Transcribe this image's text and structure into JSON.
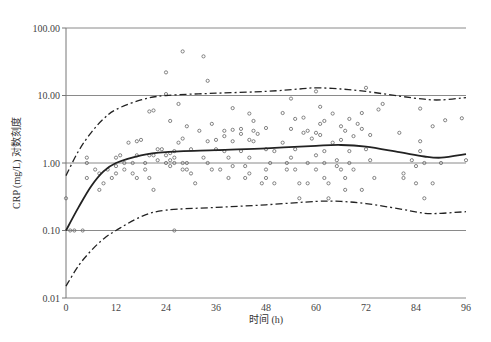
{
  "chart_data": {
    "type": "scatter",
    "title": "",
    "xlabel": "时间 (h)",
    "ylabel": "CRP (mg/L) 对数刻度",
    "x_ticks": [
      "0",
      "12",
      "24",
      "36",
      "48",
      "60",
      "72",
      "84",
      "96"
    ],
    "y_ticks": [
      "0.01",
      "0.10",
      "1.00",
      "10.00",
      "100.00"
    ],
    "xlim": [
      0,
      96
    ],
    "ylim": [
      0.01,
      100
    ],
    "yscale": "log",
    "grid": "horizontal at decades",
    "series": [
      {
        "name": "observed",
        "style": "open-circle",
        "points": [
          [
            0,
            0.3
          ],
          [
            1,
            0.1
          ],
          [
            2,
            0.1
          ],
          [
            4,
            0.1
          ],
          [
            5,
            1.2
          ],
          [
            5,
            1.0
          ],
          [
            5,
            0.6
          ],
          [
            7,
            0.8
          ],
          [
            8,
            0.4
          ],
          [
            8,
            0.7
          ],
          [
            9,
            0.5
          ],
          [
            10,
            0.8
          ],
          [
            11,
            0.6
          ],
          [
            12,
            1.2
          ],
          [
            12,
            0.9
          ],
          [
            12,
            0.7
          ],
          [
            13,
            1.3
          ],
          [
            14,
            1.0
          ],
          [
            14,
            0.8
          ],
          [
            15,
            2.0
          ],
          [
            16,
            1.0
          ],
          [
            16,
            0.7
          ],
          [
            17,
            2.1
          ],
          [
            17,
            0.6
          ],
          [
            17,
            1.3
          ],
          [
            18,
            2.2
          ],
          [
            19,
            1.0
          ],
          [
            19,
            0.8
          ],
          [
            20,
            1.3
          ],
          [
            20,
            0.6
          ],
          [
            20,
            5.8
          ],
          [
            21,
            1.3
          ],
          [
            21,
            6.0
          ],
          [
            21,
            0.4
          ],
          [
            22,
            1.1
          ],
          [
            22,
            1.6
          ],
          [
            23,
            1.6
          ],
          [
            24,
            1.3
          ],
          [
            24,
            1.0
          ],
          [
            24,
            10.5
          ],
          [
            24,
            22
          ],
          [
            25,
            4.2
          ],
          [
            25,
            1.4
          ],
          [
            25,
            1.1
          ],
          [
            25,
            0.9
          ],
          [
            26,
            0.1
          ],
          [
            26,
            1.0
          ],
          [
            26,
            1.2
          ],
          [
            26,
            1.5
          ],
          [
            27,
            7.5
          ],
          [
            27,
            2.0
          ],
          [
            28,
            45
          ],
          [
            28,
            2.3
          ],
          [
            28,
            1.0
          ],
          [
            28,
            0.8
          ],
          [
            29,
            3.5
          ],
          [
            29,
            1.0
          ],
          [
            29,
            0.8
          ],
          [
            30,
            1.6
          ],
          [
            30,
            0.7
          ],
          [
            31,
            0.5
          ],
          [
            32,
            3.0
          ],
          [
            33,
            38
          ],
          [
            33,
            1.2
          ],
          [
            34,
            1.0
          ],
          [
            34,
            2.1
          ],
          [
            34,
            16.5
          ],
          [
            35,
            3.8
          ],
          [
            35,
            0.8
          ],
          [
            36,
            2.2
          ],
          [
            36,
            1.6
          ],
          [
            37,
            0.8
          ],
          [
            38,
            3.0
          ],
          [
            38,
            2.5
          ],
          [
            38,
            1.5
          ],
          [
            39,
            1.2
          ],
          [
            39,
            0.6
          ],
          [
            40,
            6.5
          ],
          [
            40,
            3.1
          ],
          [
            40,
            2.1
          ],
          [
            40,
            0.9
          ],
          [
            42,
            3.2
          ],
          [
            42,
            2.7
          ],
          [
            42,
            1.5
          ],
          [
            43,
            0.9
          ],
          [
            43,
            0.6
          ],
          [
            44,
            5.4
          ],
          [
            44,
            2.2
          ],
          [
            44,
            1.2
          ],
          [
            44,
            0.7
          ],
          [
            45,
            4.2
          ],
          [
            45,
            3.0
          ],
          [
            45,
            2.1
          ],
          [
            46,
            2.7
          ],
          [
            47,
            0.5
          ],
          [
            48,
            0.8
          ],
          [
            48,
            3.3
          ],
          [
            48,
            1.6
          ],
          [
            48,
            0.6
          ],
          [
            49,
            1.0
          ],
          [
            50,
            0.5
          ],
          [
            50,
            1.5
          ],
          [
            52,
            5.5
          ],
          [
            52,
            2.0
          ],
          [
            53,
            1.0
          ],
          [
            53,
            0.8
          ],
          [
            54,
            9.0
          ],
          [
            54,
            3.2
          ],
          [
            54,
            1.2
          ],
          [
            55,
            4.5
          ],
          [
            55,
            1.6
          ],
          [
            55,
            0.8
          ],
          [
            56,
            0.5
          ],
          [
            56,
            0.3
          ],
          [
            57,
            4.7
          ],
          [
            57,
            2.8
          ],
          [
            58,
            3.0
          ],
          [
            58,
            1.0
          ],
          [
            58,
            0.5
          ],
          [
            59,
            2.3
          ],
          [
            60,
            2.8
          ],
          [
            60,
            1.3
          ],
          [
            60,
            0.8
          ],
          [
            60,
            11.5
          ],
          [
            61,
            6.8
          ],
          [
            61,
            3.8
          ],
          [
            61,
            2.6
          ],
          [
            62,
            4.2
          ],
          [
            62,
            1.5
          ],
          [
            62,
            1.0
          ],
          [
            62,
            0.6
          ],
          [
            63,
            0.5
          ],
          [
            63,
            0.3
          ],
          [
            64,
            5.4
          ],
          [
            64,
            2.0
          ],
          [
            65,
            1.1
          ],
          [
            65,
            0.9
          ],
          [
            66,
            3.5
          ],
          [
            66,
            2.2
          ],
          [
            66,
            0.8
          ],
          [
            67,
            3.0
          ],
          [
            67,
            0.6
          ],
          [
            67,
            0.4
          ],
          [
            68,
            4.5
          ],
          [
            68,
            1.5
          ],
          [
            68,
            1.0
          ],
          [
            69,
            2.5
          ],
          [
            69,
            0.8
          ],
          [
            70,
            3.8
          ],
          [
            71,
            5.5
          ],
          [
            71,
            3.2
          ],
          [
            71,
            0.4
          ],
          [
            72,
            1.6
          ],
          [
            72,
            13
          ],
          [
            73,
            2.6
          ],
          [
            73,
            1.1
          ],
          [
            74,
            0.6
          ],
          [
            75,
            6.2
          ],
          [
            76,
            7.5
          ],
          [
            80,
            2.8
          ],
          [
            81,
            0.6
          ],
          [
            81,
            0.7
          ],
          [
            83,
            1.1
          ],
          [
            84,
            0.9
          ],
          [
            84,
            0.5
          ],
          [
            85,
            6.4
          ],
          [
            85,
            2.1
          ],
          [
            85,
            1.5
          ],
          [
            86,
            1.0
          ],
          [
            86,
            0.3
          ],
          [
            88,
            3.5
          ],
          [
            88,
            0.5
          ],
          [
            90,
            1.0
          ],
          [
            91,
            4.3
          ],
          [
            95,
            4.6
          ],
          [
            96,
            1.1
          ]
        ]
      },
      {
        "name": "fitted median",
        "style": "solid",
        "points": [
          [
            0,
            0.1
          ],
          [
            3,
            0.22
          ],
          [
            6,
            0.45
          ],
          [
            9,
            0.75
          ],
          [
            12,
            1.0
          ],
          [
            18,
            1.3
          ],
          [
            24,
            1.45
          ],
          [
            36,
            1.55
          ],
          [
            48,
            1.65
          ],
          [
            60,
            1.8
          ],
          [
            66,
            1.85
          ],
          [
            72,
            1.75
          ],
          [
            80,
            1.45
          ],
          [
            86,
            1.25
          ],
          [
            90,
            1.2
          ],
          [
            96,
            1.35
          ]
        ]
      },
      {
        "name": "upper 95% interval",
        "style": "dash-dot",
        "points": [
          [
            0,
            0.65
          ],
          [
            3,
            1.5
          ],
          [
            6,
            2.8
          ],
          [
            9,
            4.5
          ],
          [
            12,
            6.2
          ],
          [
            18,
            8.6
          ],
          [
            24,
            10.0
          ],
          [
            36,
            10.8
          ],
          [
            48,
            11.5
          ],
          [
            56,
            12.5
          ],
          [
            60,
            13.0
          ],
          [
            66,
            12.5
          ],
          [
            72,
            11.5
          ],
          [
            80,
            9.8
          ],
          [
            86,
            8.8
          ],
          [
            90,
            8.6
          ],
          [
            96,
            9.3
          ]
        ]
      },
      {
        "name": "lower 95% interval",
        "style": "dash-dot",
        "points": [
          [
            0,
            0.015
          ],
          [
            3,
            0.03
          ],
          [
            6,
            0.05
          ],
          [
            9,
            0.075
          ],
          [
            12,
            0.1
          ],
          [
            18,
            0.16
          ],
          [
            24,
            0.2
          ],
          [
            36,
            0.22
          ],
          [
            48,
            0.24
          ],
          [
            60,
            0.27
          ],
          [
            66,
            0.27
          ],
          [
            72,
            0.25
          ],
          [
            80,
            0.21
          ],
          [
            86,
            0.18
          ],
          [
            90,
            0.18
          ],
          [
            96,
            0.19
          ]
        ]
      }
    ],
    "legend": "none"
  },
  "labels": {
    "xlabel": "时间 (h)",
    "ylabel": "CRP (mg/L) 对数刻度"
  }
}
